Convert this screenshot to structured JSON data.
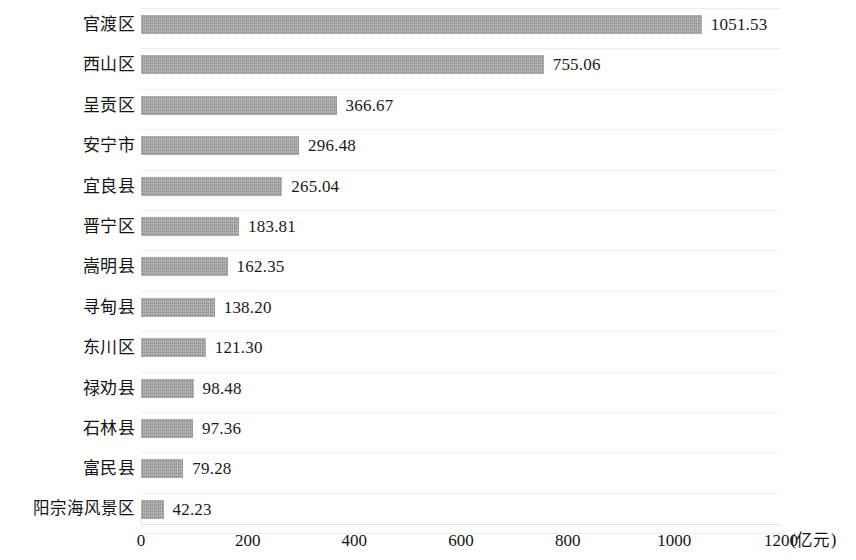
{
  "chart_data": {
    "type": "bar",
    "orientation": "horizontal",
    "title": "",
    "subtitle": "",
    "xlabel": "(亿元)",
    "ylabel": "",
    "xlim": [
      0,
      1200
    ],
    "xticks": [
      0,
      200,
      400,
      600,
      800,
      1000,
      1200
    ],
    "xtick_labels": [
      "0",
      "200",
      "400",
      "600",
      "800",
      "1000",
      "1200"
    ],
    "grid": true,
    "grid_axis": "y",
    "legend": null,
    "bar_color": "#9b9b9b",
    "categories": [
      "官渡区",
      "西山区",
      "呈贡区",
      "安宁市",
      "宜良县",
      "晋宁区",
      "嵩明县",
      "寻甸县",
      "东川区",
      "禄劝县",
      "石林县",
      "富民县",
      "阳宗海风景区"
    ],
    "values": [
      1051.53,
      755.06,
      366.67,
      296.48,
      265.04,
      183.81,
      162.35,
      138.2,
      121.3,
      98.48,
      97.36,
      79.28,
      42.23
    ],
    "value_labels": [
      "1051.53",
      "755.06",
      "366.67",
      "296.48",
      "265.04",
      "183.81",
      "162.35",
      "138.20",
      "121.30",
      "98.48",
      "97.36",
      "79.28",
      "42.23"
    ]
  }
}
